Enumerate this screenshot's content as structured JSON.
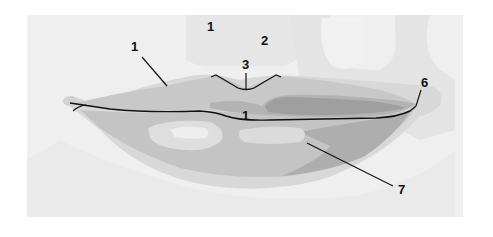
{
  "diagram": {
    "colors": {
      "page": "#ffffff",
      "panel": "#efefef",
      "skin_light": "#e4e4e4",
      "skin_mid": "#d6d6d6",
      "lip_light": "#c9c9c9",
      "lip_mid": "#b7b7b7",
      "lip_dark": "#9c9c9c",
      "highlight": "#e2e2e2",
      "highlight_bright": "#eeeeee",
      "line": "#111111"
    },
    "labels": [
      {
        "id": "label-1-upper-skin",
        "text": "1",
        "x": 211,
        "y": 31
      },
      {
        "id": "label-2-philtrum",
        "text": "2",
        "x": 265,
        "y": 45
      },
      {
        "id": "label-1-upper-lip",
        "text": "1",
        "x": 135,
        "y": 51
      },
      {
        "id": "label-3-cupids-bow",
        "text": "3",
        "x": 246,
        "y": 69
      },
      {
        "id": "label-1-stomion",
        "text": "1",
        "x": 246,
        "y": 120
      },
      {
        "id": "label-6-commissure",
        "text": "6",
        "x": 426,
        "y": 87
      },
      {
        "id": "label-7-lower-lip",
        "text": "7",
        "x": 403,
        "y": 194
      }
    ]
  }
}
